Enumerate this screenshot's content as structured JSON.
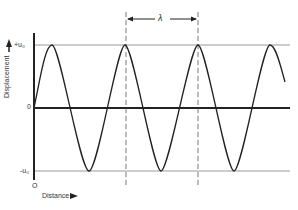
{
  "diagram": {
    "y_axis_label": "Displacement",
    "x_axis_label": "Distance",
    "y_ticks": {
      "top": "+u₀",
      "zero": "0",
      "bottom": "-u₀"
    },
    "origin_label": "O",
    "wavelength_label": "λ",
    "colors": {
      "line": "#222222",
      "grid": "#999999",
      "dash": "#555555"
    }
  }
}
